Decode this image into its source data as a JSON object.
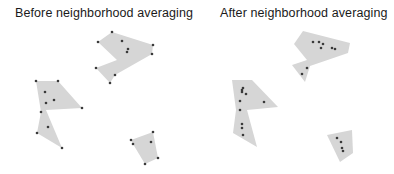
{
  "panels": [
    {
      "title": "Before neighborhood averaging",
      "polygons": [
        {
          "vertices": [
            [
              112,
              32
            ],
            [
              153,
              45
            ],
            [
              152,
              54
            ],
            [
              115,
              75
            ],
            [
              110,
              83
            ],
            [
              96,
              68
            ],
            [
              117,
              60
            ],
            [
              98,
              42
            ]
          ],
          "points": [
            [
              112,
              32
            ],
            [
              98,
              42
            ],
            [
              153,
              45
            ],
            [
              152,
              54
            ],
            [
              122,
              41
            ],
            [
              128,
              49
            ],
            [
              127,
              52
            ],
            [
              96,
              68
            ],
            [
              115,
              75
            ],
            [
              110,
              83
            ]
          ]
        },
        {
          "vertices": [
            [
              36,
              81
            ],
            [
              58,
              81
            ],
            [
              82,
              108
            ],
            [
              46,
              110
            ],
            [
              62,
              148
            ],
            [
              37,
              133
            ],
            [
              41,
              112
            ]
          ],
          "points": [
            [
              36,
              81
            ],
            [
              58,
              81
            ],
            [
              45,
              92
            ],
            [
              46,
              103
            ],
            [
              54,
              100
            ],
            [
              82,
              108
            ],
            [
              41,
              112
            ],
            [
              48,
              127
            ],
            [
              37,
              133
            ],
            [
              62,
              148
            ]
          ]
        },
        {
          "vertices": [
            [
              131,
              140
            ],
            [
              153,
              132
            ],
            [
              158,
              158
            ],
            [
              145,
              164
            ],
            [
              133,
              144
            ]
          ],
          "points": [
            [
              131,
              140
            ],
            [
              133,
              144
            ],
            [
              153,
              132
            ],
            [
              151,
              142
            ],
            [
              158,
              158
            ],
            [
              145,
              164
            ]
          ]
        }
      ]
    },
    {
      "title": "After neighborhood averaging",
      "polygons": [
        {
          "vertices": [
            [
              303,
              31
            ],
            [
              350,
              43
            ],
            [
              348,
              53
            ],
            [
              310,
              66
            ],
            [
              305,
              82
            ],
            [
              292,
              65
            ],
            [
              307,
              60
            ],
            [
              294,
              44
            ]
          ],
          "points": [
            [
              313,
              42
            ],
            [
              319,
              42
            ],
            [
              323,
              44
            ],
            [
              321,
              48
            ],
            [
              332,
              48
            ],
            [
              335,
              49
            ],
            [
              307,
              68
            ],
            [
              302,
              74
            ]
          ]
        },
        {
          "vertices": [
            [
              232,
              80
            ],
            [
              252,
              80
            ],
            [
              278,
              107
            ],
            [
              247,
              110
            ],
            [
              257,
              147
            ],
            [
              233,
              133
            ],
            [
              236,
              110
            ]
          ],
          "points": [
            [
              243,
              88
            ],
            [
              242,
              90
            ],
            [
              242,
              92
            ],
            [
              246,
              94
            ],
            [
              240,
              101
            ],
            [
              264,
              102
            ],
            [
              240,
              110
            ],
            [
              242,
              124
            ],
            [
              242,
              128
            ],
            [
              243,
              135
            ]
          ]
        },
        {
          "vertices": [
            [
              327,
              135
            ],
            [
              352,
              130
            ],
            [
              353,
              153
            ],
            [
              340,
              162
            ]
          ],
          "points": [
            [
              337,
              138
            ],
            [
              341,
              142
            ],
            [
              342,
              148
            ],
            [
              343,
              151
            ]
          ]
        }
      ]
    }
  ],
  "colors": {
    "polygon_fill": "#d6d6d6",
    "point": "#3a3a3a",
    "title": "#1a1a1a"
  }
}
